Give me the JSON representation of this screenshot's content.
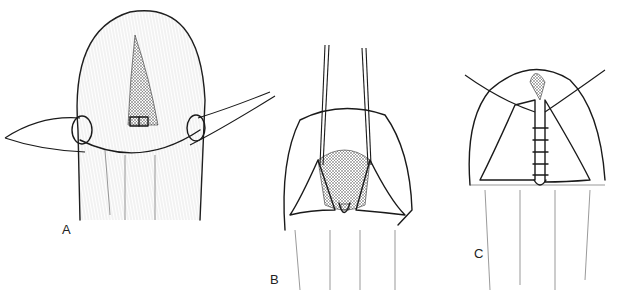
{
  "figure": {
    "panels": [
      {
        "id": "A",
        "label": "A",
        "description": "Initial suture placement with lateral stay sutures"
      },
      {
        "id": "B",
        "label": "B",
        "description": "Flaps elevated with vertical traction sutures"
      },
      {
        "id": "C",
        "label": "C",
        "description": "Flaps approximated with interrupted sutures"
      }
    ],
    "colors": {
      "ink": "#1a1a1a",
      "hatch": "#555555",
      "background": "#ffffff"
    }
  }
}
